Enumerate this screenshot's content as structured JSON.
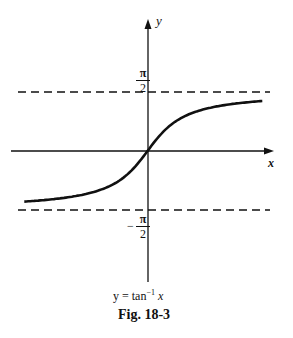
{
  "chart_data": {
    "type": "line",
    "title": "Fig. 18-3",
    "function_label": "y = tan⁻¹ x",
    "xlabel": "x",
    "ylabel": "y",
    "asymptotes": [
      {
        "y": 1.5708,
        "label": "π/2",
        "style": "dashed"
      },
      {
        "y": -1.5708,
        "label": "-π/2",
        "style": "dashed"
      }
    ],
    "ylim": [
      -2.4,
      3.5
    ],
    "xlim": [
      -4.6,
      4.3
    ],
    "grid": false,
    "series": [
      {
        "name": "y = tan^-1 x",
        "x": [
          -4.4,
          -3,
          -2,
          -1,
          -0.5,
          0,
          0.5,
          1,
          2,
          3,
          4.1
        ],
        "y": [
          -1.35,
          -1.249,
          -1.107,
          -0.785,
          -0.464,
          0,
          0.464,
          0.785,
          1.107,
          1.249,
          1.33
        ]
      }
    ]
  },
  "labels": {
    "y_axis": "y",
    "x_axis": "x",
    "upper_num": "π",
    "upper_den": "2",
    "lower_sign": "−",
    "lower_num": "π",
    "lower_den": "2",
    "caption_func": "y = tan",
    "caption_exp": "−1",
    "caption_var": " x",
    "figure": "Fig. 18-3"
  }
}
